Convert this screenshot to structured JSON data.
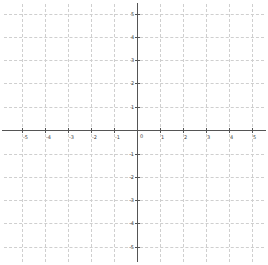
{
  "graph": {
    "type": "coordinate-plane",
    "x_range": [
      -5,
      5
    ],
    "y_range": [
      -5,
      5
    ],
    "grid": true,
    "grid_style": "dashed",
    "colors": {
      "grid": "#cfcfcf",
      "axis": "#555555",
      "label": "#444444"
    },
    "origin_label": "0",
    "x_ticks": [
      {
        "label": "-5",
        "x": 22
      },
      {
        "label": "-4",
        "x": 45
      },
      {
        "label": "-3",
        "x": 68
      },
      {
        "label": "-2",
        "x": 91
      },
      {
        "label": "-1",
        "x": 114
      },
      {
        "label": "1",
        "x": 160
      },
      {
        "label": "2",
        "x": 183
      },
      {
        "label": "3",
        "x": 206
      },
      {
        "label": "4",
        "x": 229
      },
      {
        "label": "5",
        "x": 252
      }
    ],
    "y_ticks": [
      {
        "label": "5",
        "y": 14
      },
      {
        "label": "4",
        "y": 37
      },
      {
        "label": "3",
        "y": 60
      },
      {
        "label": "2",
        "y": 83
      },
      {
        "label": "1",
        "y": 107
      },
      {
        "label": "-1",
        "y": 154
      },
      {
        "label": "-2",
        "y": 177
      },
      {
        "label": "-3",
        "y": 200
      },
      {
        "label": "-4",
        "y": 223
      },
      {
        "label": "-5",
        "y": 247
      }
    ]
  }
}
